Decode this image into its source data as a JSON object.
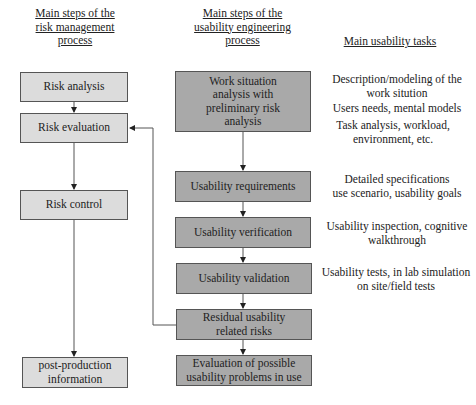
{
  "headers": {
    "risk": "Main steps of the risk management process",
    "risk_lines": [
      "Main steps of the",
      "risk management",
      "process"
    ],
    "usability": "Main steps of the usability engineering process",
    "usability_lines": [
      "Main steps of the",
      "usability engineering",
      "process"
    ],
    "tasks": "Main usability tasks"
  },
  "risk_steps": [
    {
      "label": "Risk analysis"
    },
    {
      "label": "Risk evaluation"
    },
    {
      "label": "Risk control"
    },
    {
      "label_lines": [
        "post-production",
        "information"
      ]
    }
  ],
  "usability_steps": [
    {
      "label_lines": [
        "Work situation",
        "analysis with",
        "preliminary risk",
        "analysis"
      ]
    },
    {
      "label": "Usability requirements"
    },
    {
      "label": "Usability verification"
    },
    {
      "label": "Usability validation"
    },
    {
      "label_lines": [
        "Residual usability",
        "related risks"
      ]
    },
    {
      "label_lines": [
        "Evaluation of possible",
        "usability problems in use"
      ]
    }
  ],
  "tasks": [
    {
      "lines": [
        "Description/modeling of the",
        "work sitution"
      ]
    },
    {
      "lines": [
        "Users needs, mental models"
      ]
    },
    {
      "lines": [
        "Task analysis, workload,",
        "environment, etc."
      ]
    },
    {
      "lines": [
        "Detailed specifications",
        "use scenario, usability goals"
      ]
    },
    {
      "lines": [
        "Usability inspection, cognitive",
        "walkthrough"
      ]
    },
    {
      "lines": [
        "Usability tests, in lab simulation",
        "on site/field tests"
      ]
    }
  ],
  "colors": {
    "risk_box_fill": "#dcdcdc",
    "usability_box_fill": "#a9a9a9",
    "line": "#555555"
  }
}
